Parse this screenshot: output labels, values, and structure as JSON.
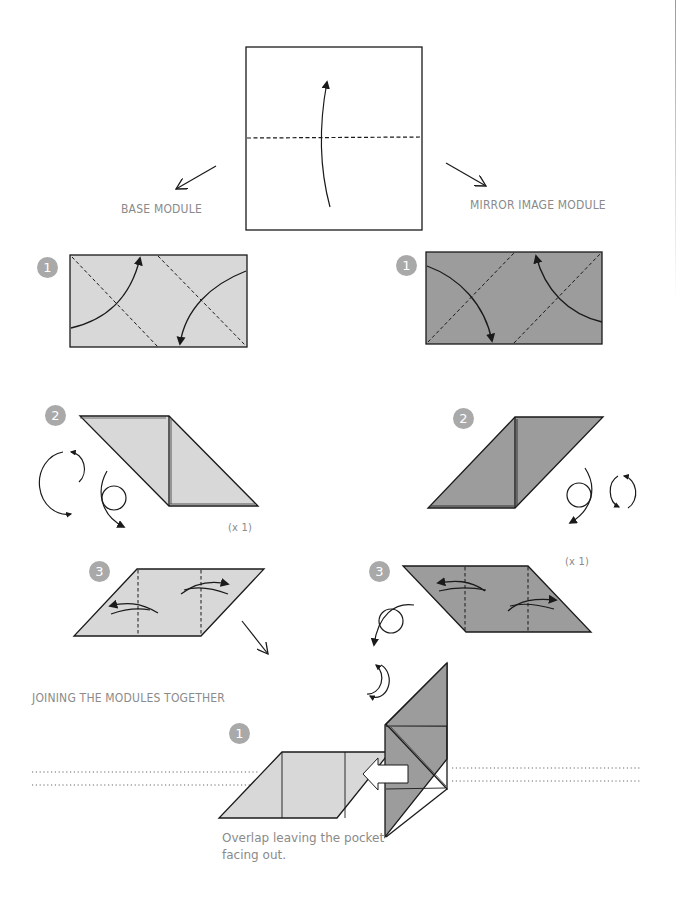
{
  "colors": {
    "light_paper": "#d8d8d8",
    "dark_paper": "#9c9c9c",
    "badge": "#a9a9a9",
    "label_text": "#8a8a8a",
    "line": "#1a1a1a",
    "dotted_guide": "#9a9a9a"
  },
  "start": {
    "description": "Square sheet folded in half upward along horizontal dashed crease"
  },
  "columns": {
    "left": {
      "title": "BASE MODULE"
    },
    "right": {
      "title": "MIRROR IMAGE MODULE"
    }
  },
  "steps": {
    "left": [
      {
        "number": "1",
        "note": ""
      },
      {
        "number": "2",
        "note": "(x 1)"
      },
      {
        "number": "3",
        "note": ""
      }
    ],
    "right": [
      {
        "number": "1",
        "note": ""
      },
      {
        "number": "2",
        "note": ""
      },
      {
        "number": "3",
        "note": "(x 1)"
      }
    ]
  },
  "joining": {
    "title": "JOINING THE MODULES TOGETHER",
    "step_number": "1",
    "caption_line1": "Overlap leaving the pocket",
    "caption_line2": "facing out."
  },
  "icons": [
    "fold-up-arrow-icon",
    "direction-arrow-icon",
    "valley-fold-arrow-icon",
    "turn-over-icon",
    "rotate-icon",
    "insert-arrow-icon"
  ]
}
